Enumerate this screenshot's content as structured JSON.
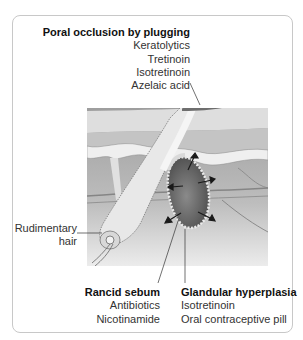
{
  "figure": {
    "colors": {
      "frame_border": "#c8c8c8",
      "plug": "#6e6e6e",
      "gland": "#5c5c5c",
      "skin_light": "#dcdcdc",
      "skin_mid": "#b4b4b4",
      "dermis": "#a8a8a8"
    }
  },
  "labels": {
    "poral": {
      "heading": "Poral occlusion by plugging",
      "items": [
        "Keratolytics",
        "Tretinoin",
        "Isotretinoin",
        "Azelaic acid"
      ]
    },
    "rudimentary": {
      "lines": [
        "Rudimentary",
        "hair"
      ]
    },
    "rancid": {
      "heading": "Rancid sebum",
      "items": [
        "Antibiotics",
        "Nicotinamide"
      ]
    },
    "glandular": {
      "heading": "Glandular hyperplasia",
      "items": [
        "Isotretinoin",
        "Oral contraceptive pill"
      ]
    }
  }
}
